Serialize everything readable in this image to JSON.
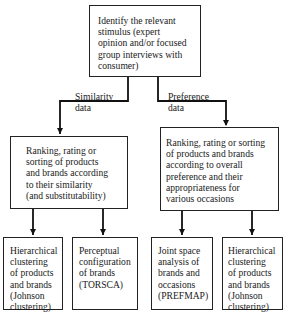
{
  "diagram": {
    "type": "flowchart",
    "nodes": {
      "stimulus": "Identify the relevant\nstimulus (expert\nopinion and/or focused\ngroup interviews with\nconsumer)",
      "similarity_ranking": "Ranking, rating or\nsorting of products\nand brands according\nto their similarity\n(and substitutability)",
      "preference_ranking": "Ranking, rating or sorting\nof products and brands\naccording to overall\npreference and their\nappropriateness for\nvarious occasions",
      "hier_cluster_left": "Hierarchical\nclustering\nof products\nand brands\n(Johnson\nclustering)",
      "perceptual_config": "Perceptual\nconfiguration\nof brands\n(TORSCA)",
      "joint_space": "Joint space\nanalysis of\nbrands and\noccasions\n(PREFMAP)",
      "hier_cluster_right": "Hierarchical\nclustering\nof products\nand brands\n(Johnson\nclustering)"
    },
    "edge_labels": {
      "similarity": "Similarity\ndata",
      "preference": "Preference\ndata"
    },
    "edges": [
      {
        "from": "stimulus",
        "to": "similarity_ranking",
        "label": "Similarity data"
      },
      {
        "from": "stimulus",
        "to": "preference_ranking",
        "label": "Preference data"
      },
      {
        "from": "similarity_ranking",
        "to": "hier_cluster_left"
      },
      {
        "from": "similarity_ranking",
        "to": "perceptual_config"
      },
      {
        "from": "preference_ranking",
        "to": "joint_space"
      },
      {
        "from": "preference_ranking",
        "to": "hier_cluster_right"
      }
    ]
  }
}
